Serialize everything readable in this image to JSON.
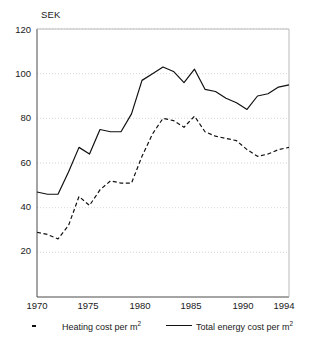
{
  "chart_data": {
    "type": "line",
    "title": "",
    "ylabel": "SEK",
    "xlabel": "",
    "xlim": [
      1970,
      1994
    ],
    "ylim": [
      0,
      120
    ],
    "yticks": [
      20,
      40,
      60,
      80,
      100,
      120
    ],
    "xticks": [
      1970,
      1975,
      1980,
      1985,
      1990,
      1994
    ],
    "grid": true,
    "grid_axis": "y",
    "legend_position": "below-axes",
    "x": [
      1970,
      1971,
      1972,
      1973,
      1974,
      1975,
      1976,
      1977,
      1978,
      1979,
      1980,
      1981,
      1982,
      1983,
      1984,
      1985,
      1986,
      1987,
      1988,
      1989,
      1990,
      1991,
      1992,
      1993,
      1994
    ],
    "series": [
      {
        "name": "Heating cost per m2",
        "label": "Heating cost per m",
        "superscript": "2",
        "style": "dashed",
        "color": "#111111",
        "values": [
          29,
          28,
          26,
          32,
          45,
          41,
          48,
          52,
          51,
          51,
          63,
          73,
          80,
          79,
          76,
          81,
          74,
          72,
          71,
          70,
          66,
          63,
          64,
          66,
          67
        ]
      },
      {
        "name": "Total energy cost per m2",
        "label": "Total energy cost per m",
        "superscript": "2",
        "style": "solid",
        "color": "#111111",
        "values": [
          47,
          46,
          46,
          56,
          67,
          64,
          75,
          74,
          74,
          82,
          97,
          100,
          103,
          101,
          96,
          102,
          93,
          92,
          89,
          87,
          84,
          90,
          91,
          94,
          95
        ]
      }
    ]
  },
  "colors": {
    "line": "#111111",
    "grid": "#c9c9d4",
    "axis": "#4a4a4a",
    "background": "#ffffff"
  }
}
